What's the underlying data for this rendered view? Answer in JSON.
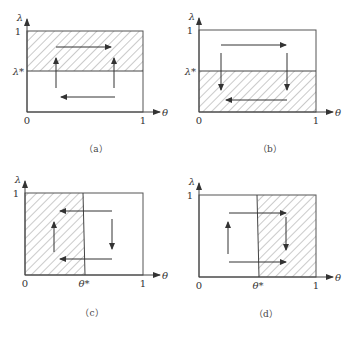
{
  "figure": {
    "colors": {
      "line": "#444444",
      "hatch": "#7a7a7a",
      "background": "#ffffff"
    },
    "panels": [
      {
        "id": "a",
        "caption": "（a）",
        "caption_pos": [
          96,
          152
        ],
        "origin": [
          27,
          112
        ],
        "top": 31,
        "right": 143,
        "y_axis_label": "λ",
        "x_axis_label": "θ",
        "label_zero": "0",
        "label_one_x": "1",
        "label_one_y": "1",
        "threshold": {
          "axis": "y",
          "label": "λ*",
          "pos": 71
        },
        "shaded": {
          "x1": 27,
          "y1": 31,
          "x2": 143,
          "y2": 71
        },
        "arrows": [
          {
            "dir": "right",
            "x1": 56,
            "y1": 47,
            "x2": 111,
            "y2": 47
          },
          {
            "dir": "up",
            "x1": 56,
            "y1": 88,
            "x2": 56,
            "y2": 58
          },
          {
            "dir": "up",
            "x1": 114,
            "y1": 88,
            "x2": 114,
            "y2": 58
          },
          {
            "dir": "left",
            "x1": 115,
            "y1": 97,
            "x2": 61,
            "y2": 97
          }
        ]
      },
      {
        "id": "b",
        "caption": "（b）",
        "caption_pos": [
          270,
          152
        ],
        "origin": [
          199,
          112
        ],
        "top": 30,
        "right": 316,
        "y_axis_label": "λ",
        "x_axis_label": "θ",
        "label_zero": "0",
        "label_one_x": "1",
        "label_one_y": "1",
        "threshold": {
          "axis": "y",
          "label": "λ*",
          "pos": 71
        },
        "shaded": {
          "x1": 199,
          "y1": 71,
          "x2": 316,
          "y2": 112
        },
        "arrows": [
          {
            "dir": "right",
            "x1": 221,
            "y1": 45,
            "x2": 286,
            "y2": 45
          },
          {
            "dir": "down",
            "x1": 221,
            "y1": 53,
            "x2": 221,
            "y2": 90
          },
          {
            "dir": "down",
            "x1": 287,
            "y1": 53,
            "x2": 287,
            "y2": 90
          },
          {
            "dir": "left",
            "x1": 287,
            "y1": 100,
            "x2": 226,
            "y2": 100
          }
        ]
      },
      {
        "id": "c",
        "caption": "（c）",
        "caption_pos": [
          92,
          316
        ],
        "origin": [
          25,
          275
        ],
        "top": 193,
        "right": 143,
        "y_axis_label": "λ",
        "x_axis_label": "θ",
        "label_zero": "0",
        "label_one_x": "1",
        "label_one_y": "1",
        "threshold": {
          "axis": "x",
          "label": "θ*",
          "pos": 84
        },
        "shaded": {
          "x1": 25,
          "y1": 193,
          "x2": 84,
          "y2": 275
        },
        "arrows": [
          {
            "dir": "left",
            "x1": 112,
            "y1": 211,
            "x2": 60,
            "y2": 211
          },
          {
            "dir": "left",
            "x1": 112,
            "y1": 259,
            "x2": 60,
            "y2": 259
          },
          {
            "dir": "up",
            "x1": 54,
            "y1": 252,
            "x2": 54,
            "y2": 222
          },
          {
            "dir": "down",
            "x1": 112,
            "y1": 219,
            "x2": 112,
            "y2": 249
          }
        ]
      },
      {
        "id": "d",
        "caption": "（d）",
        "caption_pos": [
          266,
          317
        ],
        "origin": [
          199,
          277
        ],
        "top": 195,
        "right": 316,
        "y_axis_label": "λ",
        "x_axis_label": "θ",
        "label_zero": "0",
        "label_one_x": "1",
        "label_one_y": "1",
        "threshold": {
          "axis": "x",
          "label": "θ*",
          "pos": 258
        },
        "shaded": {
          "x1": 258,
          "y1": 195,
          "x2": 316,
          "y2": 277
        },
        "arrows": [
          {
            "dir": "right",
            "x1": 229,
            "y1": 213,
            "x2": 286,
            "y2": 213
          },
          {
            "dir": "right",
            "x1": 229,
            "y1": 262,
            "x2": 286,
            "y2": 262
          },
          {
            "dir": "up",
            "x1": 228,
            "y1": 254,
            "x2": 228,
            "y2": 222
          },
          {
            "dir": "down",
            "x1": 286,
            "y1": 217,
            "x2": 286,
            "y2": 250
          }
        ]
      }
    ]
  }
}
